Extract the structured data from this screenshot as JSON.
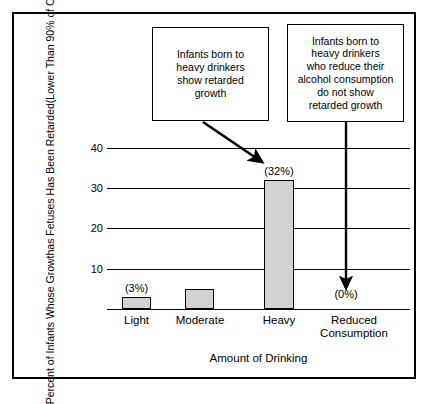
{
  "figure": {
    "has_frame": true,
    "background_color": "#ffffff",
    "bar_fill_color": "#d2d2d2",
    "line_color": "#000000"
  },
  "callouts": [
    {
      "name": "growth-callout",
      "lines": [
        "Infants born to",
        "heavy drinkers",
        "show retarded",
        "growth"
      ],
      "points_to": "Heavy"
    },
    {
      "name": "reduced-callout",
      "lines": [
        "Infants born to",
        "heavy drinkers",
        "who reduce their",
        "alcohol consumption",
        "do not show",
        "retarded growth"
      ],
      "points_to": "Reduced Consumption"
    }
  ],
  "chart_data": {
    "type": "bar",
    "title": "",
    "categories": [
      "Light",
      "Moderate",
      "Heavy",
      "Reduced Consumption"
    ],
    "category_lines": [
      [
        "Light"
      ],
      [
        "Moderate"
      ],
      [
        "Heavy"
      ],
      [
        "Reduced",
        "Consumption"
      ]
    ],
    "values": [
      3,
      5,
      32,
      0
    ],
    "data_labels": [
      "(3%)",
      "",
      "(32%)",
      "(0%)"
    ],
    "xlabel": "Amount of Drinking",
    "ylabel": "Percent of Infants Whose Growth as Fetuses Has Been Retarded (Lower Than 90% of Other Infants)",
    "ylabel_lines": [
      "Percent of Infants Whose Growth",
      "as Fetuses Has Been Retarded",
      "(Lower Than 90% of Other Infants)"
    ],
    "ylim": [
      0,
      41
    ],
    "yticks": [
      40,
      30,
      20,
      10
    ],
    "ytick_labels": [
      "40",
      "30",
      "20",
      "10"
    ],
    "grid": true,
    "grid_axis": "y",
    "legend": "none"
  }
}
